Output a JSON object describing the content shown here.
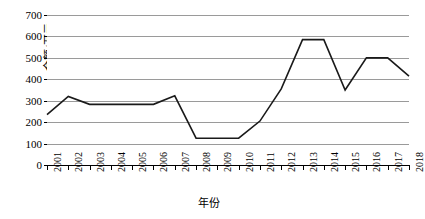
{
  "chart_data": {
    "type": "line",
    "title": "",
    "xlabel": "年份",
    "ylabel": "金额/万元",
    "categories": [
      "2001",
      "2002",
      "2003",
      "2004",
      "2005",
      "2006",
      "2007",
      "2008",
      "2009",
      "2010",
      "2011",
      "2012",
      "2013",
      "2014",
      "2015",
      "2016",
      "2017",
      "2018"
    ],
    "values": [
      235,
      320,
      283,
      283,
      283,
      283,
      323,
      125,
      125,
      125,
      205,
      355,
      585,
      585,
      350,
      500,
      500,
      415
    ],
    "series": [
      {
        "name": "金额",
        "values": [
          235,
          320,
          283,
          283,
          283,
          283,
          323,
          125,
          125,
          125,
          205,
          355,
          585,
          585,
          350,
          500,
          500,
          415
        ]
      }
    ],
    "ylim": [
      0,
      700
    ],
    "yticks": [
      0,
      100,
      200,
      300,
      400,
      500,
      600,
      700
    ],
    "ytick_labels": [
      "0",
      "100",
      "200",
      "300",
      "400",
      "500",
      "600",
      "700"
    ],
    "grid": true,
    "legend": "none",
    "line_color": "#1a1a1a",
    "grid_color": "#9a9a9a",
    "axis_color": "#000000",
    "background_color": "#ffffff"
  }
}
